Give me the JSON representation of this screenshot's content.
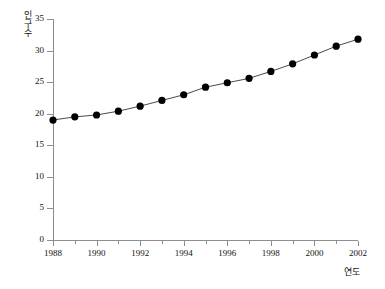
{
  "chart_data": {
    "type": "line",
    "title": "",
    "xlabel": "연도",
    "ylabel": "인구수",
    "x": [
      1988,
      1989,
      1990,
      1991,
      1992,
      1993,
      1994,
      1995,
      1996,
      1997,
      1998,
      1999,
      2000,
      2001,
      2002
    ],
    "values": [
      19.0,
      19.5,
      19.8,
      20.4,
      21.2,
      22.1,
      23.0,
      24.2,
      24.9,
      25.6,
      26.7,
      27.9,
      29.3,
      30.7,
      31.8
    ],
    "categories": [
      "1988",
      "1989",
      "1990",
      "1991",
      "1992",
      "1993",
      "1994",
      "1995",
      "1996",
      "1997",
      "1998",
      "1999",
      "2000",
      "2001",
      "2002"
    ],
    "xlim": [
      1988,
      2002
    ],
    "ylim": [
      0,
      35
    ],
    "y_ticks": [
      0,
      5,
      10,
      15,
      20,
      25,
      30,
      35
    ],
    "y_tick_labels": [
      "0",
      "5",
      "10",
      "15",
      "20",
      "25",
      "30",
      "35"
    ],
    "x_major_ticks": [
      1988,
      1990,
      1992,
      1994,
      1996,
      1998,
      2000,
      2002
    ],
    "x_major_tick_labels": [
      "1988",
      "1990",
      "1992",
      "1994",
      "1996",
      "1998",
      "2000",
      "2002"
    ],
    "x_minor_ticks": [
      1989,
      1991,
      1993,
      1995,
      1997,
      1999,
      2001
    ],
    "grid": false,
    "legend": false,
    "marker": "filled-circle",
    "marker_color": "#000000",
    "line_color": "#4a4a4a",
    "spines": [
      "left",
      "bottom"
    ]
  }
}
